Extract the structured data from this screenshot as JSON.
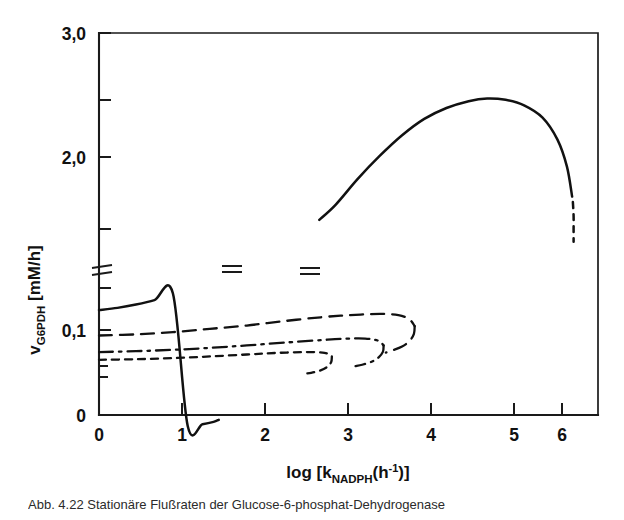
{
  "figure": {
    "background_color": "#ffffff",
    "ink_color": "#111111",
    "caption_partial": "Abb. 4.22  Stationäre Flußraten der Glucose-6-phosphat-Dehydrogenase"
  },
  "chart_data": {
    "type": "line",
    "title": "",
    "xlabel": "log [k_NADPH(h^-1)]",
    "xlabel_parts": {
      "lead": "log [k",
      "sub": "NADPH",
      "mid": "(h",
      "sup": "-1",
      "tail": ")]"
    },
    "ylabel": "v_G6PDH [mM/h]",
    "ylabel_parts": {
      "lead": "v",
      "sub": "G6PDH",
      "tail": " [mM/h]"
    },
    "xlim": [
      0,
      6.75
    ],
    "xticks": [
      0,
      1,
      2,
      3,
      4,
      5,
      6
    ],
    "xticklabels": [
      "0",
      "1",
      "2",
      "3",
      "4",
      "5",
      "6"
    ],
    "y_axis_broken": true,
    "y_break_note": "Axis broken between 0.1 and 1.5; lower segment expanded",
    "ylim_lower": [
      0,
      0.115
    ],
    "ylim_upper": [
      1.35,
      3.0
    ],
    "yticks_lower": [
      0,
      0.1
    ],
    "yticklabels_lower": [
      "0",
      "0,1"
    ],
    "yticks_upper": [
      1.5,
      2.0,
      2.5,
      3.0
    ],
    "yticklabels_upper": [
      "",
      "2,0",
      "",
      "3,0"
    ],
    "grid": false,
    "legend": "none",
    "series": [
      {
        "name": "upper-branch-solid",
        "style": "solid",
        "has_axis_break_marker": true,
        "segments": [
          {
            "id": "solid-low-start",
            "comment": "rises from y-axis, truncated at curve break marker near x=1.6",
            "points": [
              [
                0,
                0.095
              ],
              [
                0.25,
                0.097
              ],
              [
                0.5,
                0.1
              ],
              [
                0.75,
                0.104
              ],
              [
                1.0,
                0.11
              ],
              [
                1.2,
                0.118
              ],
              [
                1.4,
                0.131
              ],
              [
                1.55,
                0.148
              ],
              [
                1.62,
                0.163
              ]
            ]
          },
          {
            "id": "solid-upper-main",
            "comment": "resumes after break at x=3, peaks ~2.52 near x=5.2",
            "points": [
              [
                2.98,
                1.63
              ],
              [
                3.2,
                1.74
              ],
              [
                3.5,
                1.93
              ],
              [
                3.8,
                2.1
              ],
              [
                4.1,
                2.25
              ],
              [
                4.4,
                2.37
              ],
              [
                4.7,
                2.45
              ],
              [
                5.0,
                2.5
              ],
              [
                5.25,
                2.52
              ],
              [
                5.5,
                2.51
              ],
              [
                5.75,
                2.47
              ],
              [
                6.0,
                2.38
              ],
              [
                6.2,
                2.22
              ],
              [
                6.33,
                2.02
              ],
              [
                6.4,
                1.8
              ]
            ]
          },
          {
            "id": "solid-dashed-tail",
            "style": "dashed",
            "comment": "unstable branch descending at right edge",
            "points": [
              [
                6.41,
                1.76
              ],
              [
                6.42,
                1.66
              ],
              [
                6.42,
                1.56
              ],
              [
                6.42,
                1.47
              ]
            ]
          }
        ]
      },
      {
        "name": "branch-long-dash",
        "style": "long-dash",
        "start_value": 0.072,
        "turning_point_x": 4.25,
        "points_out": [
          [
            0,
            0.072
          ],
          [
            0.5,
            0.073
          ],
          [
            1.0,
            0.075
          ],
          [
            1.5,
            0.078
          ],
          [
            2.0,
            0.081
          ],
          [
            2.5,
            0.085
          ],
          [
            3.0,
            0.0885
          ],
          [
            3.4,
            0.0905
          ],
          [
            3.8,
            0.0915
          ],
          [
            4.05,
            0.0905
          ],
          [
            4.2,
            0.0865
          ],
          [
            4.27,
            0.0805
          ]
        ],
        "points_back": [
          [
            4.27,
            0.0805
          ],
          [
            4.26,
            0.0735
          ],
          [
            4.2,
            0.067
          ],
          [
            4.1,
            0.062
          ],
          [
            3.97,
            0.0585
          ],
          [
            3.88,
            0.0565
          ]
        ]
      },
      {
        "name": "branch-dash-dot",
        "style": "dash-dot",
        "start_value": 0.057,
        "turning_point_x": 3.82,
        "points_out": [
          [
            0,
            0.057
          ],
          [
            0.5,
            0.0578
          ],
          [
            1.0,
            0.059
          ],
          [
            1.5,
            0.0608
          ],
          [
            2.0,
            0.063
          ],
          [
            2.5,
            0.0655
          ],
          [
            3.0,
            0.0678
          ],
          [
            3.3,
            0.069
          ],
          [
            3.6,
            0.0692
          ],
          [
            3.78,
            0.0672
          ],
          [
            3.85,
            0.063
          ]
        ],
        "points_back": [
          [
            3.85,
            0.063
          ],
          [
            3.84,
            0.0572
          ],
          [
            3.78,
            0.052
          ],
          [
            3.68,
            0.048
          ],
          [
            3.56,
            0.0455
          ],
          [
            3.47,
            0.0443
          ]
        ]
      },
      {
        "name": "branch-short-dash",
        "style": "short-dash",
        "start_value": 0.05,
        "turning_point_x": 3.12,
        "points_out": [
          [
            0,
            0.05
          ],
          [
            0.5,
            0.0505
          ],
          [
            1.0,
            0.0515
          ],
          [
            1.5,
            0.053
          ],
          [
            2.0,
            0.0548
          ],
          [
            2.4,
            0.0562
          ],
          [
            2.8,
            0.057
          ],
          [
            3.05,
            0.0563
          ],
          [
            3.15,
            0.053
          ]
        ],
        "points_back": [
          [
            3.15,
            0.053
          ],
          [
            3.14,
            0.0478
          ],
          [
            3.08,
            0.0432
          ],
          [
            2.98,
            0.04
          ],
          [
            2.87,
            0.0382
          ],
          [
            2.78,
            0.0375
          ]
        ]
      }
    ]
  }
}
